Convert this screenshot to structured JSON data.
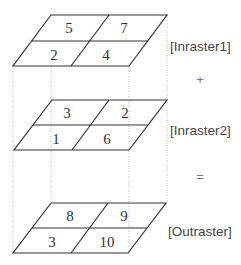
{
  "diagram": {
    "layers": [
      {
        "id": "inraster1",
        "label": "[Inraster1]",
        "cells": {
          "top_left": "5",
          "top_right": "7",
          "bottom_left": "2",
          "bottom_right": "4"
        }
      },
      {
        "id": "inraster2",
        "label": "[Inraster2]",
        "cells": {
          "top_left": "3",
          "top_right": "2",
          "bottom_left": "1",
          "bottom_right": "6"
        }
      },
      {
        "id": "outraster",
        "label": "[Outraster]",
        "cells": {
          "top_left": "8",
          "top_right": "9",
          "bottom_left": "3",
          "bottom_right": "10"
        }
      }
    ],
    "operators": {
      "between_1_2": "+",
      "between_2_out": "="
    }
  }
}
